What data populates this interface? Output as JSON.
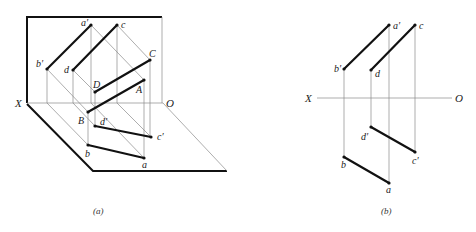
{
  "figure_a": {
    "caption": "(a)",
    "axis": {
      "x_label": "X",
      "o_label": "O"
    },
    "space_points": {
      "A": "A",
      "B": "B",
      "C": "C",
      "D": "D"
    },
    "front_projections": {
      "a_prime": "a′",
      "b_prime": "b′",
      "c_prime": "c′",
      "d_prime": "d′"
    },
    "top_projections": {
      "a": "a",
      "b": "b",
      "c": "c",
      "d": "d"
    }
  },
  "figure_b": {
    "caption": "(b)",
    "axis": {
      "x_label": "X",
      "o_label": "O"
    },
    "points": {
      "a_prime": "a′",
      "b_prime": "b′",
      "c": "c",
      "d": "d",
      "d_prime": "d′",
      "c_prime": "c′",
      "b": "b",
      "a": "a"
    }
  }
}
